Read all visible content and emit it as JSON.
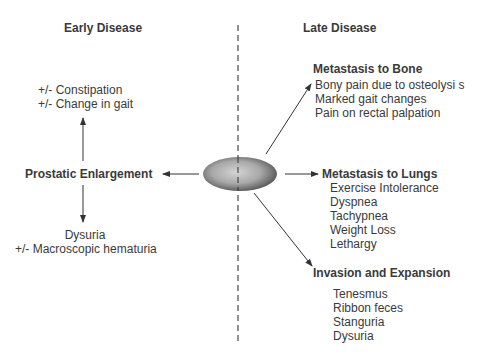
{
  "headers": {
    "early": "Early Disease",
    "late": "Late Disease"
  },
  "center_node": {
    "shape": "gradient-ellipse",
    "colors": {
      "center": "#cfcfcf",
      "edge": "#5a5a5a"
    }
  },
  "early": {
    "main": "Prostatic Enlargement",
    "up_items": [
      "+/- Constipation",
      "+/- Change in gait"
    ],
    "down_items": [
      "Dysuria",
      "+/- Macroscopic hematuria"
    ]
  },
  "late": {
    "bone": {
      "title": "Metastasis to Bone",
      "items": [
        "Bony pain due to osteolysi s",
        "Marked gait changes",
        "Pain on rectal palpation"
      ]
    },
    "lungs": {
      "title": "Metastasis to Lungs",
      "items": [
        "Exercise Intolerance",
        "Dyspnea",
        "Tachypnea",
        "Weight Loss",
        "Lethargy"
      ]
    },
    "invasion": {
      "title": "Invasion and Expansion",
      "items": [
        "Tenesmus",
        "Ribbon feces",
        "Stanguria",
        "Dysuria"
      ]
    }
  }
}
